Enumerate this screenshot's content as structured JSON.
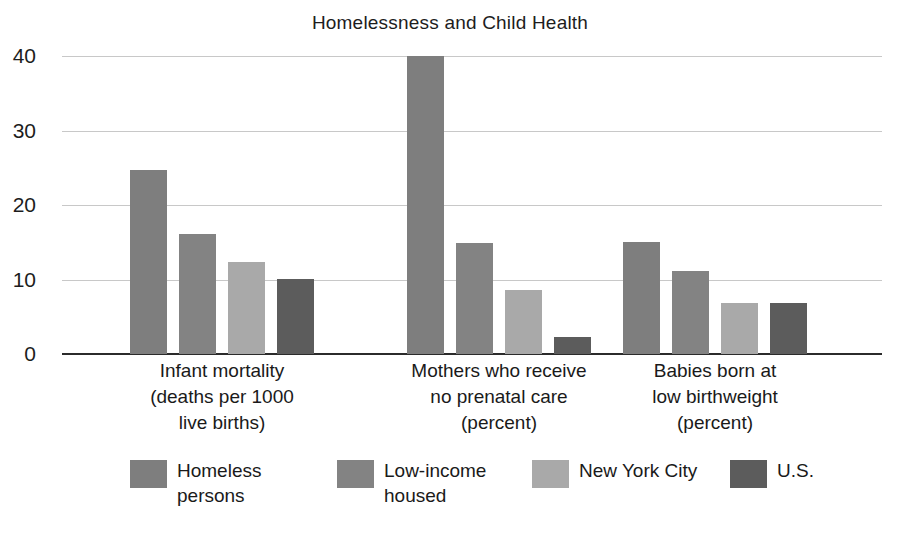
{
  "chart_data": {
    "type": "bar",
    "title": "Homelessness and Child Health",
    "xlabel": "",
    "ylabel": "",
    "ylim": [
      0,
      40
    ],
    "yticks": [
      0,
      10,
      20,
      30,
      40
    ],
    "grid": true,
    "legend_position": "bottom",
    "categories": [
      "Infant mortality\n(deaths per 1000\nlive births)",
      "Mothers who receive\nno prenatal care\n(percent)",
      "Babies born at\nlow birthweight\n(percent)"
    ],
    "series": [
      {
        "name": "Homeless\npersons",
        "color": "#7e7e7e",
        "values": [
          24.7,
          40.0,
          15.1
        ]
      },
      {
        "name": "Low-income\nhoused",
        "color": "#838383",
        "values": [
          16.1,
          14.9,
          11.2
        ]
      },
      {
        "name": "New York City",
        "color": "#a9a9a9",
        "values": [
          12.3,
          8.6,
          6.8
        ]
      },
      {
        "name": "U.S.",
        "color": "#5c5c5c",
        "values": [
          10.1,
          2.3,
          6.9
        ]
      }
    ]
  },
  "axis": {
    "tick_labels": [
      "40",
      "30",
      "20",
      "10",
      "0"
    ]
  },
  "legend": {
    "items": [
      {
        "label": "Homeless\npersons",
        "color": "#7e7e7e"
      },
      {
        "label": "Low-income\nhoused",
        "color": "#838383"
      },
      {
        "label": "New York City",
        "color": "#a9a9a9"
      },
      {
        "label": "U.S.",
        "color": "#5c5c5c"
      }
    ]
  }
}
